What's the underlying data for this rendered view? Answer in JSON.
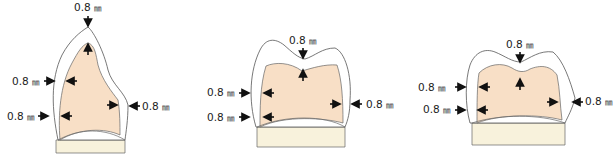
{
  "colors": {
    "core": "#f8dfc6",
    "base": "#f8f2dc",
    "outline": "#555555",
    "arrow": "#111111"
  },
  "diagrams": [
    {
      "name": "anterior-tooth",
      "labels": {
        "top": "0.8",
        "left_upper": "0.8",
        "left_lower": "0.8",
        "right": "0.8"
      },
      "unit": "㎜"
    },
    {
      "name": "premolar-tooth",
      "labels": {
        "top": "0.8",
        "left_upper": "0.8",
        "left_lower": "0.8",
        "right": "0.8"
      },
      "unit": "㎜"
    },
    {
      "name": "molar-tooth",
      "labels": {
        "top": "0.8",
        "left_upper": "0.8",
        "left_lower": "0.8",
        "right": "0.8"
      },
      "unit": "㎜"
    }
  ]
}
